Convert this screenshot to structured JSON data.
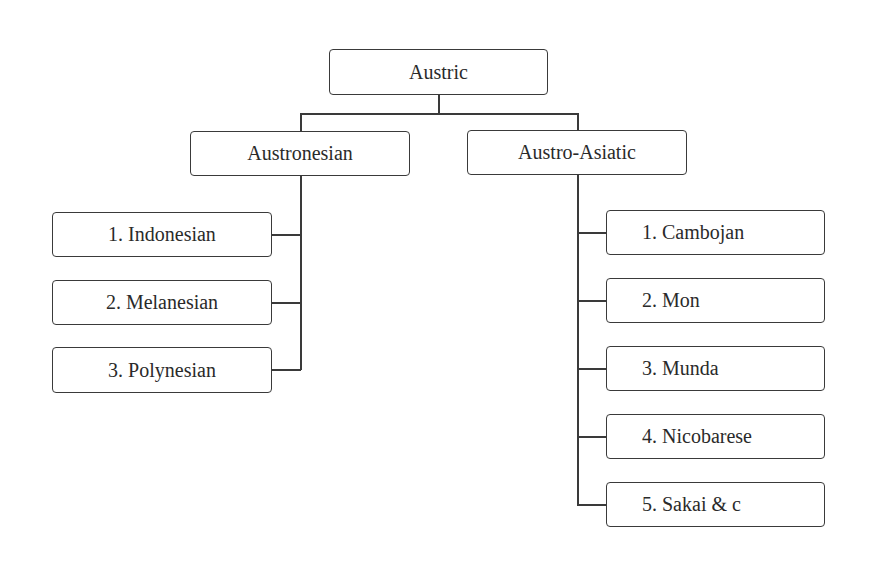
{
  "diagram": {
    "root": {
      "label": "Austric"
    },
    "branches": [
      {
        "label": "Austronesian",
        "children": [
          "1. Indonesian",
          "2. Melanesian",
          "3. Polynesian"
        ]
      },
      {
        "label": "Austro-Asiatic",
        "children": [
          "1. Cambojan",
          "2. Mon",
          "3. Munda",
          "4. Nicobarese",
          "5. Sakai & c"
        ]
      }
    ]
  }
}
